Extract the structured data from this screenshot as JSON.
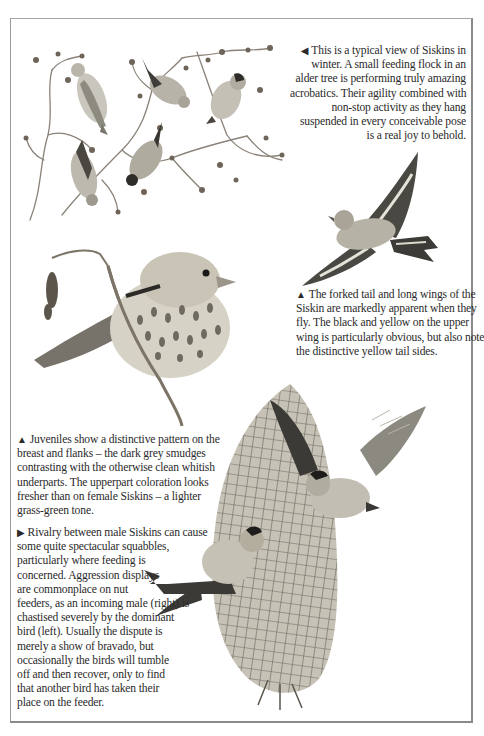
{
  "page": {
    "border_color": "#8a8a8a",
    "background": "#ffffff"
  },
  "illustrations": [
    {
      "id": "flock-in-alder",
      "description": "Small feeding flock of five Siskins in an alder tree"
    },
    {
      "id": "siskin-in-flight",
      "description": "Siskin in flight showing forked tail and long wings"
    },
    {
      "id": "juvenile-siskin",
      "description": "Juvenile Siskin perched on alder twig with catkins"
    },
    {
      "id": "nut-feeder-squabble",
      "description": "Two male Siskins squabbling on a mesh nut feeder"
    }
  ],
  "captions": {
    "flock": {
      "marker": "◀",
      "lines": [
        "This is a typical view of Siskins in",
        "winter. A small feeding flock in an",
        "alder tree is performing truly amazing",
        "acrobatics. Their agility combined with",
        "non-stop activity as they hang",
        "suspended in every conceivable pose",
        "is a real joy to behold."
      ]
    },
    "flight": {
      "marker": "▲",
      "lines": [
        "The forked tail and long wings of the",
        "Siskin are markedly apparent when they",
        "fly. The black and yellow on the upper",
        "wing is particularly obvious, but also note",
        "the distinctive yellow tail sides."
      ]
    },
    "juvenile": {
      "marker": "▲",
      "lines": [
        "Juveniles show a distinctive pattern on the",
        "breast and flanks – the dark grey smudges",
        "contrasting with the otherwise clean whitish",
        "underparts. The upperpart coloration looks",
        "fresher than on female Siskins – a lighter",
        "grass-green tone."
      ]
    },
    "rivalry": {
      "marker": "▶",
      "lines": [
        "Rivalry between male Siskins can cause",
        "some quite spectacular squabbles,",
        "particularly where feeding is",
        "concerned. Aggression displays",
        "are commonplace on nut",
        "feeders, as an incoming male (right) is",
        "chastised severely by the dominant",
        "bird (left). Usually the dispute is",
        "merely a show of bravado, but",
        "occasionally the birds will tumble",
        "off and then recover, only to find",
        "that another bird has taken their",
        "place on the feeder."
      ]
    }
  }
}
